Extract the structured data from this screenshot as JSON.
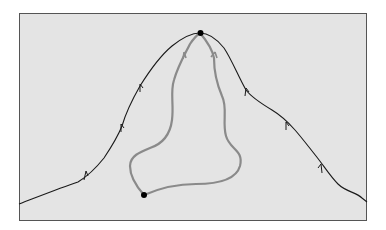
{
  "diagram": {
    "title": "",
    "colors": {
      "page_background": "#ffffff",
      "panel_background": "#e4e4e4",
      "panel_border": "#555555",
      "ridge": "#1a1a1a",
      "path": "#8a8a8a",
      "point": "#000000"
    },
    "points": [
      {
        "name": "summit",
        "label": ""
      },
      {
        "name": "base",
        "label": ""
      }
    ],
    "paths": [
      {
        "name": "ridge-line",
        "kind": "ridge",
        "arrow_direction": "uphill",
        "arrow_count": 7
      },
      {
        "name": "left-route",
        "kind": "route",
        "arrow_direction": "uphill"
      },
      {
        "name": "right-route",
        "kind": "route",
        "arrow_direction": "uphill"
      }
    ]
  }
}
